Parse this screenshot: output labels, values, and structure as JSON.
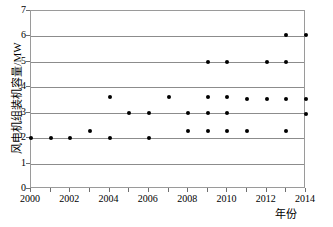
{
  "chart_data": {
    "type": "scatter",
    "title": "",
    "xlabel": "年份",
    "ylabel": "风电机组装机容量/MW",
    "xlim": [
      2000,
      2014
    ],
    "ylim": [
      0,
      7
    ],
    "grid": true,
    "legend": null,
    "x_tick_labels": [
      "2000",
      "2002",
      "2004",
      "2006",
      "2008",
      "2010",
      "2012",
      "2014"
    ],
    "x_tick_values": [
      2000,
      2002,
      2004,
      2006,
      2008,
      2010,
      2012,
      2014
    ],
    "x_minor_tick_values": [
      2001,
      2003,
      2005,
      2007,
      2009,
      2011,
      2013
    ],
    "y_tick_labels": [
      "0",
      "1",
      "2",
      "3",
      "4",
      "5",
      "6",
      "7"
    ],
    "y_tick_values": [
      0,
      1,
      2,
      3,
      4,
      5,
      6,
      7
    ],
    "gridline_values": [
      1,
      2,
      3,
      4,
      5,
      6
    ],
    "marker_color": "#000000",
    "gridline_color": "#8c8c8c",
    "frame_color": "#9a9a9a",
    "points": [
      {
        "x": 2000,
        "y": 2.0
      },
      {
        "x": 2001,
        "y": 2.0
      },
      {
        "x": 2002,
        "y": 2.0
      },
      {
        "x": 2003,
        "y": 2.3
      },
      {
        "x": 2004,
        "y": 2.0
      },
      {
        "x": 2004,
        "y": 3.6
      },
      {
        "x": 2005,
        "y": 3.0
      },
      {
        "x": 2006,
        "y": 2.0
      },
      {
        "x": 2006,
        "y": 3.0
      },
      {
        "x": 2007,
        "y": 3.6
      },
      {
        "x": 2008,
        "y": 2.3
      },
      {
        "x": 2008,
        "y": 3.0
      },
      {
        "x": 2009,
        "y": 2.3
      },
      {
        "x": 2009,
        "y": 3.0
      },
      {
        "x": 2009,
        "y": 3.6
      },
      {
        "x": 2009,
        "y": 5.0
      },
      {
        "x": 2010,
        "y": 2.3
      },
      {
        "x": 2010,
        "y": 3.0
      },
      {
        "x": 2010,
        "y": 3.6
      },
      {
        "x": 2010,
        "y": 5.0
      },
      {
        "x": 2011,
        "y": 2.3
      },
      {
        "x": 2011,
        "y": 3.55
      },
      {
        "x": 2012,
        "y": 3.55
      },
      {
        "x": 2012,
        "y": 5.0
      },
      {
        "x": 2013,
        "y": 2.3
      },
      {
        "x": 2013,
        "y": 3.55
      },
      {
        "x": 2013,
        "y": 5.0
      },
      {
        "x": 2013,
        "y": 6.05
      },
      {
        "x": 2014,
        "y": 2.95
      },
      {
        "x": 2014,
        "y": 3.55
      },
      {
        "x": 2014,
        "y": 6.05
      }
    ]
  }
}
